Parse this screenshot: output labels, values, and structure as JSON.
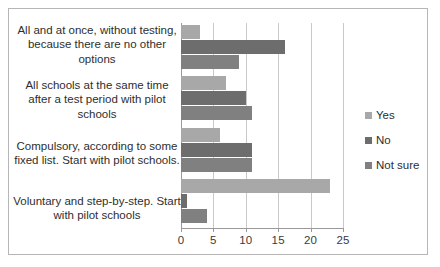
{
  "chart_data": {
    "type": "bar",
    "orientation": "horizontal",
    "title": "",
    "xlabel": "",
    "ylabel": "",
    "xlim": [
      0,
      25
    ],
    "xticks": [
      0,
      5,
      10,
      15,
      20,
      25
    ],
    "grid": true,
    "legend_position": "right",
    "categories": [
      "All and at once, without testing, because there are no other options",
      "All schools at the same time after a test period with pilot schools",
      "Compulsory, according to some fixed list. Start with pilot schools.",
      "Voluntary and step-by-step. Start with pilot schools"
    ],
    "series": [
      {
        "name": "Yes",
        "color": "#a8a8a8",
        "values": [
          3,
          7,
          6,
          23
        ]
      },
      {
        "name": "No",
        "color": "#6d6d6d",
        "values": [
          16,
          10,
          11,
          1
        ]
      },
      {
        "name": "Not sure",
        "color": "#808080",
        "values": [
          9,
          11,
          11,
          4
        ]
      }
    ]
  },
  "legend": {
    "items": [
      {
        "label": "Yes"
      },
      {
        "label": "No"
      },
      {
        "label": "Not sure"
      }
    ]
  },
  "axis": {
    "tick_labels": [
      "0",
      "5",
      "10",
      "15",
      "20",
      "25"
    ]
  }
}
